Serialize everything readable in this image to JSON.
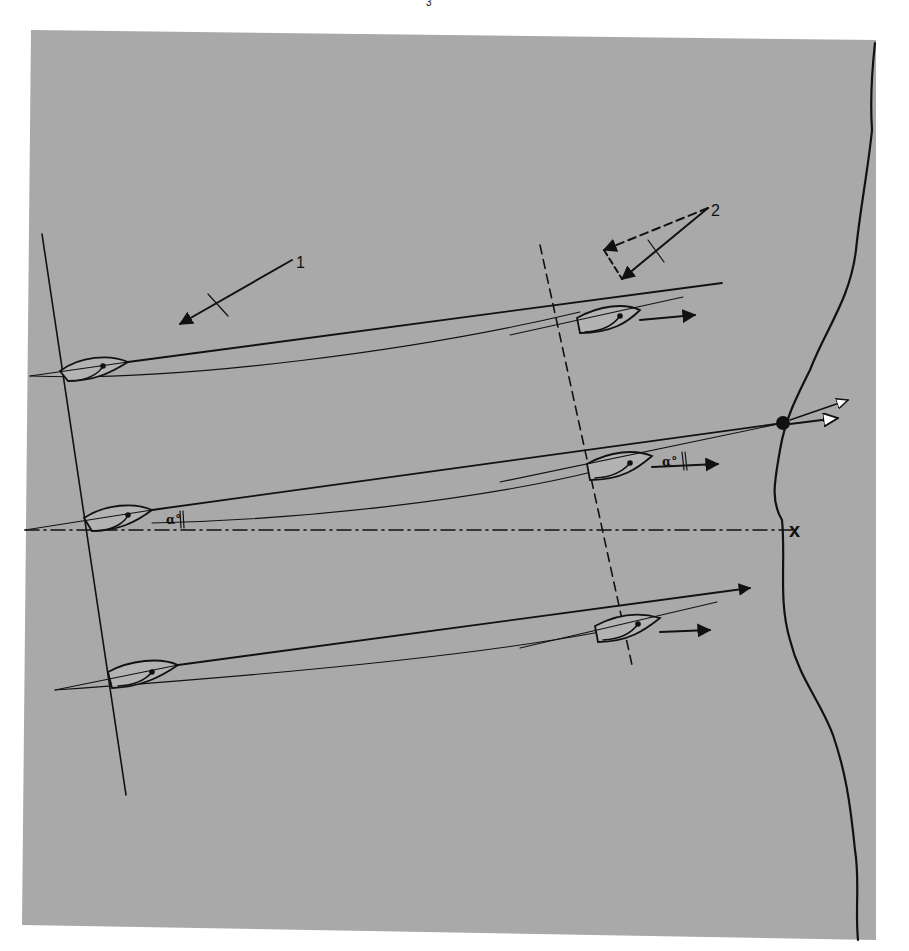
{
  "figure": {
    "background": "#ffffff",
    "panel_color": "#a9a9a9",
    "ink_color": "#111111",
    "page_mark": "3",
    "panel": {
      "points": "31,30 876,40 876,940 22,925"
    }
  },
  "wind": {
    "wind_1": {
      "label": "1",
      "line": [
        292,
        260,
        180,
        324
      ],
      "tick": [
        208,
        294,
        228,
        316
      ],
      "label_pos": [
        296,
        268
      ]
    },
    "wind_2": {
      "label": "2",
      "true_line": [
        708,
        208,
        622,
        279
      ],
      "tick": [
        648,
        240,
        664,
        262
      ],
      "dashed_a": [
        708,
        208,
        604,
        250
      ],
      "dashed_b": [
        604,
        250,
        622,
        279
      ],
      "label_pos": [
        711,
        216
      ]
    }
  },
  "lines": {
    "starting_line": [
      42,
      234,
      126,
      795
    ],
    "dashed_transit": [
      540,
      245,
      632,
      665
    ],
    "dash_dot_reference": [
      25,
      530,
      792,
      530
    ],
    "mark_x_label": "x",
    "mark_x_pos": [
      796,
      537
    ]
  },
  "shore": {
    "path": "M875,43 C872,70 870,100 872,130 C868,170 860,210 856,250 C850,300 825,330 810,370 C795,400 785,420 780,450 C775,480 770,500 782,520 C786,560 778,600 790,640 C800,680 820,700 833,735 C845,770 850,800 855,850 C860,880 855,910 858,940"
  },
  "mark": {
    "name": "mark-buoy",
    "cx": 783,
    "cy": 423,
    "r": 7
  },
  "boats": [
    {
      "id": "boat-top-start",
      "hull": "M60,371 C80,356 110,354 128,362 C112,372 95,381 68,381 Z",
      "centerline": [
        30,
        376,
        128,
        362
      ],
      "sheet": "M72,381 C90,380 100,372 103,366",
      "dot": [
        103,
        366
      ]
    },
    {
      "id": "boat-mid-start",
      "hull": "M84,518 C105,504 135,502 152,510 C136,522 118,531 92,531 Z",
      "centerline": [
        25,
        530,
        152,
        510
      ],
      "sheet": "M95,531 C115,530 125,522 128,515",
      "dot": [
        128,
        515
      ]
    },
    {
      "id": "boat-low-start",
      "hull": "M108,672 C130,660 160,657 178,665 C162,676 142,687 112,688 Z",
      "centerline": [
        55,
        690,
        178,
        665
      ],
      "sheet": "M118,686 C138,685 148,677 152,672",
      "dot": [
        152,
        672
      ]
    },
    {
      "id": "boat-top-advanced",
      "hull": "M577,318 C600,305 625,303 640,310 C628,322 612,333 580,333 Z",
      "centerline": [
        510,
        335,
        683,
        297
      ],
      "sheet": "M585,332 C606,331 615,323 620,316",
      "dot": [
        620,
        316
      ],
      "heading_arrow": [
        640,
        320,
        695,
        315
      ]
    },
    {
      "id": "boat-mid-advanced",
      "hull": "M587,464 C610,451 635,449 652,456 C638,468 622,480 590,480 Z",
      "centerline": [
        500,
        482,
        783,
        423
      ],
      "sheet": "M595,478 C616,477 625,469 630,463",
      "dot": [
        630,
        463
      ],
      "heading_arrow": [
        652,
        467,
        718,
        464
      ]
    },
    {
      "id": "boat-low-advanced",
      "hull": "M595,626 C617,614 640,612 660,618 C645,630 628,642 598,642 Z",
      "centerline": [
        520,
        648,
        717,
        602
      ],
      "sheet": "M603,640 C624,639 633,631 638,624",
      "dot": [
        638,
        624
      ],
      "heading_arrow": [
        660,
        632,
        710,
        630
      ]
    }
  ],
  "courses": {
    "top_straight": [
      128,
      362,
      722,
      283
    ],
    "top_curve": "M30,376 C180,382 420,350 580,312",
    "mid_straight": [
      152,
      510,
      783,
      423
    ],
    "mid_curve": "M152,523 C300,520 480,500 600,470",
    "low_straight": [
      178,
      665,
      750,
      588
    ],
    "low_curve": "M55,690 C200,680 450,660 600,632"
  },
  "mark_arrows": {
    "open_arrow_upper": [
      790,
      420,
      848,
      400
    ],
    "open_arrow_lower": [
      790,
      424,
      838,
      418
    ]
  },
  "angle_labels": [
    {
      "text": "α°",
      "pos": [
        662,
        466
      ],
      "bracket": [
        682,
        452,
        684,
        470
      ]
    },
    {
      "text": "α°",
      "pos": [
        166,
        524
      ],
      "bracket": [
        180,
        511,
        181,
        528
      ]
    }
  ]
}
